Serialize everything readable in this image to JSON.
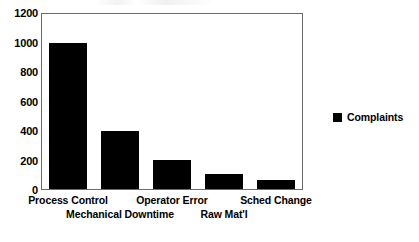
{
  "chart_data": {
    "type": "bar",
    "title": "",
    "subtitle": "",
    "xlabel": "",
    "ylabel": "",
    "categories": [
      "Process Control",
      "Mechanical Downtime",
      "Operator Error",
      "Raw Mat'l",
      "Sched Change"
    ],
    "category_label_rows": [
      0,
      1,
      0,
      1,
      0
    ],
    "series": [
      {
        "name": "Complaints",
        "color": "#000000",
        "values": [
          1000,
          400,
          200,
          100,
          60
        ]
      }
    ],
    "values": [
      1000,
      400,
      200,
      100,
      60
    ],
    "ylim": [
      0,
      1200
    ],
    "ytick_values": [
      0,
      200,
      400,
      600,
      800,
      1000,
      1200
    ],
    "ytick_labels": [
      "0",
      "200",
      "400",
      "600",
      "800",
      "1000",
      "1200"
    ],
    "grid": false,
    "legend_position": "right",
    "legend": [
      {
        "label": "Complaints",
        "swatch_color": "#000000"
      }
    ],
    "axis_color": "#6b6b6b",
    "background_color": "#ffffff"
  }
}
